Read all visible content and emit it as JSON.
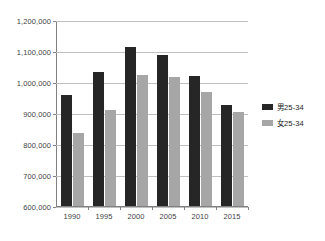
{
  "chart_data": {
    "type": "bar",
    "title": "",
    "subtitle": "",
    "xlabel": "",
    "ylabel": "",
    "categories": [
      "1990",
      "1995",
      "2000",
      "2005",
      "2010",
      "2015"
    ],
    "series": [
      {
        "name": "男25-34",
        "color": "#262626",
        "values": [
          962000,
          1035000,
          1116000,
          1090000,
          1023000,
          930000
        ]
      },
      {
        "name": "女25-34",
        "color": "#a6a6a6",
        "values": [
          838000,
          912000,
          1026000,
          1019000,
          970000,
          905000
        ]
      }
    ],
    "ylim": [
      600000,
      1200000
    ],
    "ytick_values": [
      1200000,
      1100000,
      1000000,
      900000,
      800000,
      700000,
      600000
    ],
    "ytick_labels": [
      "1,200,000",
      "1,100,000",
      "1,000,000",
      "900,000",
      "800,000",
      "700,000",
      "600,000"
    ],
    "grid": true,
    "legend_position": "right",
    "legend": [
      "男25-34",
      "女25-34"
    ]
  }
}
